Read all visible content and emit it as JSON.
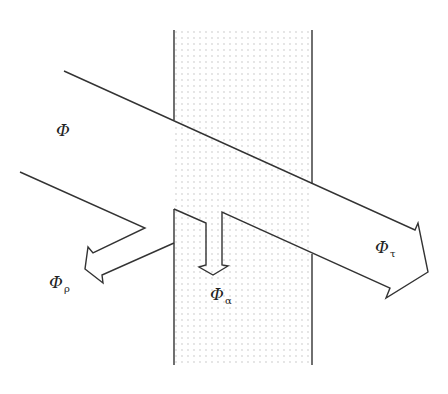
{
  "diagram": {
    "colors": {
      "line": "#333333",
      "stipple": "#b8b8b8",
      "background": "#ffffff"
    },
    "labels": {
      "incident": {
        "symbol": "Φ",
        "subscript": ""
      },
      "reflected": {
        "symbol": "Φ",
        "subscript": "ρ"
      },
      "absorbed": {
        "symbol": "Φ",
        "subscript": "α"
      },
      "transmitted": {
        "symbol": "Φ",
        "subscript": "τ"
      }
    }
  }
}
